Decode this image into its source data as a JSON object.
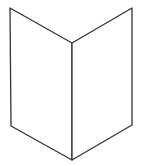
{
  "figure": {
    "stroke_color": "#333333",
    "background": "#ffffff",
    "vertices": {
      "top_left": [
        10,
        8
      ],
      "top_center": [
        72,
        43
      ],
      "top_right": [
        132,
        8
      ],
      "bottom_left": [
        11,
        126
      ],
      "bottom_center": [
        72,
        160
      ],
      "bottom_right": [
        132,
        125
      ]
    }
  }
}
